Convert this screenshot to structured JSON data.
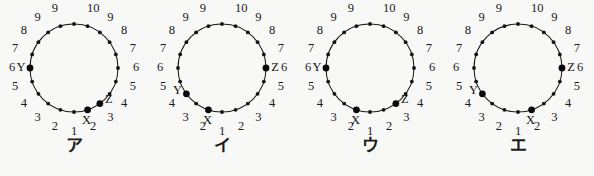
{
  "figure": {
    "background_color": "#f8f8f7",
    "ink_color": "#1a1a1a",
    "description_kind": "multiple-choice geometry figure with four ring diagrams",
    "ring": {
      "dot_count": 20,
      "radius": 44,
      "center_x": 74,
      "center_y": 68,
      "dot_radius": 1.9,
      "major_dot_radius": 3.4
    },
    "tick_labels": {
      "values": [
        "1",
        "2",
        "3",
        "4",
        "5",
        "6",
        "7",
        "8",
        "9",
        "10",
        "9",
        "8",
        "7",
        "6",
        "5",
        "4",
        "3",
        "2"
      ],
      "positions_note": "1 at bottom, ascending counter-clockwise and clockwise to 10 at top",
      "label_radius": 62
    },
    "diagrams": [
      {
        "id": "diagram-a",
        "option_label": "ア",
        "points": [
          {
            "name": "X",
            "tick": "2",
            "slot": 1,
            "side": "right"
          },
          {
            "name": "Y",
            "tick": "6",
            "slot": 15,
            "side": "left"
          },
          {
            "name": "Z",
            "tick": "8",
            "slot": 2,
            "side": "right"
          }
        ]
      },
      {
        "id": "diagram-i",
        "option_label": "イ",
        "points": [
          {
            "name": "X",
            "tick": "2",
            "slot": 19,
            "side": "left"
          },
          {
            "name": "Y",
            "tick": "8",
            "slot": 17,
            "side": "left"
          },
          {
            "name": "Z",
            "tick": "6",
            "slot": 5,
            "side": "right"
          }
        ]
      },
      {
        "id": "diagram-u",
        "option_label": "ウ",
        "points": [
          {
            "name": "X",
            "tick": "2",
            "slot": 19,
            "side": "left"
          },
          {
            "name": "Y",
            "tick": "6",
            "slot": 15,
            "side": "left"
          },
          {
            "name": "Z",
            "tick": "8",
            "slot": 2,
            "side": "right"
          }
        ]
      },
      {
        "id": "diagram-e",
        "option_label": "エ",
        "points": [
          {
            "name": "X",
            "tick": "2",
            "slot": 1,
            "side": "right"
          },
          {
            "name": "Y",
            "tick": "8",
            "slot": 17,
            "side": "left"
          },
          {
            "name": "Z",
            "tick": "6",
            "slot": 5,
            "side": "right"
          }
        ]
      }
    ]
  }
}
